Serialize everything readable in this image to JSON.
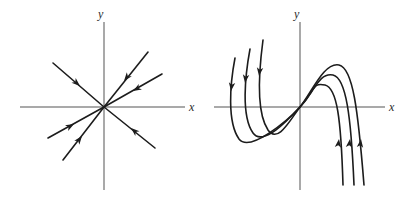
{
  "figure": {
    "width": 412,
    "height": 199,
    "background_color": "#ffffff",
    "axis_color": "#8d8d8d",
    "curve_color": "#1c1c1c"
  },
  "panels": [
    {
      "id": "left",
      "name": "star-node-phase-portrait",
      "description": "Proper node (star point): six straight rays through the origin, all arrows pointing inward toward the origin",
      "origin": [
        104,
        107
      ],
      "axes": {
        "x_label": "x",
        "y_label": "y",
        "x_label_pos": [
          190,
          110
        ],
        "y_label_pos": [
          98,
          17
        ],
        "x_range_px": [
          20,
          185
        ],
        "y_range_px": [
          22,
          190
        ]
      },
      "rays": [
        {
          "name": "ray-upper-left",
          "from": [
            53,
            63
          ],
          "to": [
            104,
            107
          ],
          "arrow_at": [
            80,
            86
          ],
          "arrow_angle_deg": 41
        },
        {
          "name": "ray-lower-right",
          "from": [
            155,
            148
          ],
          "to": [
            104,
            107
          ],
          "arrow_at": [
            131,
            128
          ],
          "arrow_angle_deg": 221
        },
        {
          "name": "ray-upper-right-steep",
          "from": [
            148,
            52
          ],
          "to": [
            104,
            107
          ],
          "arrow_at": [
            124,
            81
          ],
          "arrow_angle_deg": 129
        },
        {
          "name": "ray-lower-left-steep",
          "from": [
            63,
            160
          ],
          "to": [
            104,
            107
          ],
          "arrow_at": [
            82,
            136
          ],
          "arrow_angle_deg": 309
        },
        {
          "name": "ray-upper-right-shallow",
          "from": [
            162,
            74
          ],
          "to": [
            104,
            107
          ],
          "arrow_at": [
            133,
            91
          ],
          "arrow_angle_deg": 150
        },
        {
          "name": "ray-lower-left-shallow",
          "from": [
            48,
            138
          ],
          "to": [
            104,
            107
          ],
          "arrow_at": [
            74,
            124
          ],
          "arrow_angle_deg": 330
        }
      ]
    },
    {
      "id": "right",
      "name": "cubic-trajectories-phase-portrait",
      "description": "Three S-shaped cubic-like trajectories; left branches flow downward, right branches flow upward, all approaching the origin",
      "origin": [
        94,
        107
      ],
      "axes": {
        "x_label": "x",
        "y_label": "y",
        "x_label_pos": [
          184,
          110
        ],
        "y_label_pos": [
          88,
          17
        ],
        "x_range_px": [
          8,
          179
        ],
        "y_range_px": [
          22,
          190
        ]
      },
      "curves": [
        {
          "name": "trajectory-outer",
          "path": "M 57,40 C 53,70 50,112 62,130 C 72,144 84,120 94,107 C 106,92 118,62 133,65 C 147,68 152,110 158,185",
          "arrow_left": {
            "at": [
              54,
              75
            ],
            "angle_deg": 97
          },
          "arrow_right": {
            "at": [
              156,
              140
            ],
            "angle_deg": 277
          }
        },
        {
          "name": "trajectory-middle",
          "path": "M 44,49 C 39,76 35,116 47,133 C 57,147 82,120 94,107 C 108,92 113,72 127,75 C 140,78 145,115 148,185",
          "arrow_left": {
            "at": [
              40,
              82
            ],
            "angle_deg": 97
          },
          "arrow_right": {
            "at": [
              145,
              140
            ],
            "angle_deg": 277
          }
        },
        {
          "name": "trajectory-inner",
          "path": "M 29,58 C 24,84 21,122 33,139 C 44,153 82,120 94,107 C 110,90 106,82 119,85 C 131,88 135,118 137,185",
          "arrow_left": {
            "at": [
              26,
              90
            ],
            "angle_deg": 97
          },
          "arrow_right": {
            "at": [
              134,
              140
            ],
            "angle_deg": 277
          }
        }
      ]
    }
  ]
}
